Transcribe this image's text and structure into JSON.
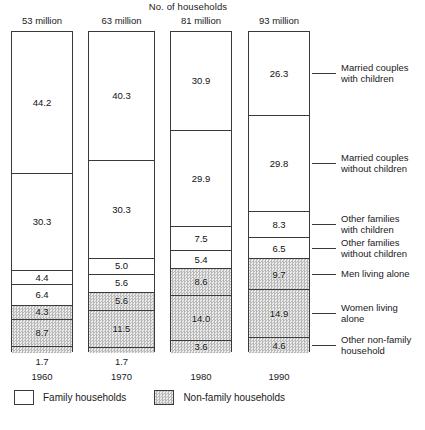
{
  "chart_data": {
    "type": "bar",
    "title": "No. of households",
    "subtitle": "",
    "xlabel": "",
    "ylabel": "",
    "stacked": true,
    "units": "millions of households",
    "categories": [
      "1960",
      "1970",
      "1980",
      "1990"
    ],
    "column_totals": [
      "53 million",
      "63 million",
      "81 million",
      "93 million"
    ],
    "totals_numeric": [
      53,
      63,
      81,
      93
    ],
    "series": [
      {
        "name": "Married couples with children",
        "group": "Family households",
        "shaded": false,
        "values": [
          44.2,
          40.3,
          30.9,
          26.3
        ]
      },
      {
        "name": "Married couples without children",
        "group": "Family households",
        "shaded": false,
        "values": [
          30.3,
          30.3,
          29.9,
          29.8
        ]
      },
      {
        "name": "Other families with children",
        "group": "Family households",
        "shaded": false,
        "values": [
          4.4,
          5.0,
          7.5,
          8.3
        ]
      },
      {
        "name": "Other families without children",
        "group": "Family households",
        "shaded": false,
        "values": [
          6.4,
          5.6,
          5.4,
          6.5
        ]
      },
      {
        "name": "Men living alone",
        "group": "Non-family households",
        "shaded": true,
        "values": [
          4.3,
          5.6,
          8.6,
          9.7
        ]
      },
      {
        "name": "Women living alone",
        "group": "Non-family households",
        "shaded": true,
        "values": [
          8.7,
          11.5,
          14.0,
          14.9
        ]
      },
      {
        "name": "Other non-family household",
        "group": "Non-family households",
        "shaded": true,
        "values": [
          1.7,
          1.7,
          3.6,
          4.6
        ]
      }
    ],
    "legend": [
      {
        "label": "Family households",
        "shaded": false
      },
      {
        "label": "Non-family households",
        "shaded": true
      }
    ],
    "legend_position": "bottom-left",
    "category_labels_position": "right",
    "grid": false
  },
  "columns": [
    {
      "year": "1960",
      "total": "53 million",
      "segments": [
        {
          "value": "44.2",
          "shaded": false
        },
        {
          "value": "30.3",
          "shaded": false
        },
        {
          "value": "4.4",
          "shaded": false
        },
        {
          "value": "6.4",
          "shaded": false
        },
        {
          "value": "4.3",
          "shaded": true
        },
        {
          "value": "8.7",
          "shaded": true
        },
        {
          "value": "1.7",
          "shaded": true
        }
      ]
    },
    {
      "year": "1970",
      "total": "63 million",
      "segments": [
        {
          "value": "40.3",
          "shaded": false
        },
        {
          "value": "30.3",
          "shaded": false
        },
        {
          "value": "5.0",
          "shaded": false
        },
        {
          "value": "5.6",
          "shaded": false
        },
        {
          "value": "5.6",
          "shaded": true
        },
        {
          "value": "11.5",
          "shaded": true
        },
        {
          "value": "1.7",
          "shaded": true
        }
      ]
    },
    {
      "year": "1980",
      "total": "81 million",
      "segments": [
        {
          "value": "30.9",
          "shaded": false
        },
        {
          "value": "29.9",
          "shaded": false
        },
        {
          "value": "7.5",
          "shaded": false
        },
        {
          "value": "5.4",
          "shaded": false
        },
        {
          "value": "8.6",
          "shaded": true
        },
        {
          "value": "14.0",
          "shaded": true
        },
        {
          "value": "3.6",
          "shaded": true
        }
      ]
    },
    {
      "year": "1990",
      "total": "93 million",
      "segments": [
        {
          "value": "26.3",
          "shaded": false
        },
        {
          "value": "29.8",
          "shaded": false
        },
        {
          "value": "8.3",
          "shaded": false
        },
        {
          "value": "6.5",
          "shaded": false
        },
        {
          "value": "9.7",
          "shaded": true
        },
        {
          "value": "14.9",
          "shaded": true
        },
        {
          "value": "4.6",
          "shaded": true
        }
      ]
    }
  ],
  "category_labels": [
    "Married couples\nwith children",
    "Married couples\nwithout children",
    "Other families\nwith children",
    "Other families\nwithout children",
    "Men living alone",
    "Women living\nalone",
    "Other non-family\nhousehold"
  ],
  "legend": {
    "family_label": "Family households",
    "nonfamily_label": "Non-family households"
  },
  "title": "No. of households",
  "colors": {
    "ink": "#1a1a1a",
    "rule": "#3a3a3a",
    "family_fill": "#ffffff",
    "nonfamily_fill": "#d2d2d2",
    "background": "#ffffff"
  }
}
